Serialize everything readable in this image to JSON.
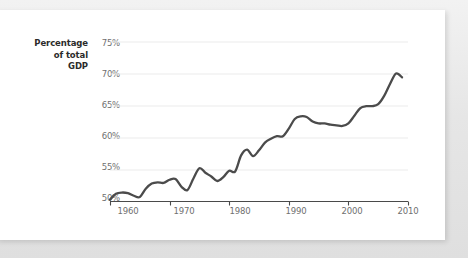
{
  "chart_data": {
    "type": "line",
    "title": "",
    "subtitle": "",
    "xlabel": "",
    "ylabel": "Percentage of total GDP",
    "ylabel_lines": [
      "Percentage",
      "of total",
      "GDP"
    ],
    "xlim": [
      1960,
      2010
    ],
    "ylim": [
      50,
      75
    ],
    "ytick_labels": [
      "50%",
      "55%",
      "60%",
      "65%",
      "70%",
      "75%"
    ],
    "ytick_values": [
      50,
      55,
      60,
      65,
      70,
      75
    ],
    "xtick_labels": [
      "1960",
      "1970",
      "1980",
      "1990",
      "2000",
      "2010"
    ],
    "xtick_values": [
      1960,
      1970,
      1980,
      1990,
      2000,
      2010
    ],
    "grid": "horizontal",
    "legend": "none",
    "series": [
      {
        "name": "Percentage of total GDP",
        "color": "#4b4b4b",
        "x": [
          1960,
          1961,
          1962,
          1963,
          1964,
          1965,
          1966,
          1967,
          1968,
          1969,
          1970,
          1971,
          1972,
          1973,
          1974,
          1975,
          1976,
          1977,
          1978,
          1979,
          1980,
          1981,
          1982,
          1983,
          1984,
          1985,
          1986,
          1987,
          1988,
          1989,
          1990,
          1991,
          1992,
          1993,
          1994,
          1995,
          1996,
          1997,
          1998,
          1999,
          2000,
          2001,
          2002,
          2003,
          2004,
          2005,
          2006,
          2007,
          2008,
          2009
        ],
        "values": [
          50.3,
          51.2,
          51.4,
          51.3,
          50.9,
          50.7,
          52.0,
          52.8,
          53.0,
          52.9,
          53.4,
          53.5,
          52.3,
          51.8,
          53.6,
          55.2,
          54.5,
          53.9,
          53.2,
          53.8,
          54.8,
          54.7,
          57.2,
          58.1,
          57.1,
          58.0,
          59.2,
          59.8,
          60.2,
          60.2,
          61.4,
          62.9,
          63.3,
          63.2,
          62.5,
          62.2,
          62.2,
          62.0,
          61.9,
          61.8,
          62.2,
          63.4,
          64.6,
          64.9,
          64.9,
          65.2,
          66.5,
          68.4,
          70.0,
          69.4
        ]
      }
    ],
    "colors": {
      "line": "#4b4b4b",
      "grid": "#ebebeb",
      "axis": "#4a4a4a",
      "tick_text": "#6f6f6f",
      "label_text": "#2b2b2b",
      "card_background": "#ffffff",
      "page_background": "#e9e9e9"
    }
  }
}
